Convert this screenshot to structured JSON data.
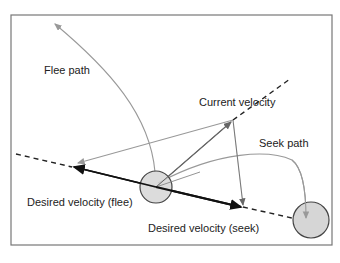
{
  "diagram": {
    "labels": {
      "flee_path": "Flee path",
      "current_velocity": "Current velocity",
      "seek_path": "Seek path",
      "desired_flee": "Desired velocity (flee)",
      "desired_seek": "Desired velocity (seek)"
    },
    "colors": {
      "frame": "#777777",
      "path": "#999999",
      "vector": "#666666",
      "desired": "#111111",
      "circle_fill": "#d6d6d6",
      "circle_stroke": "#444444"
    },
    "elements": [
      "agent-circle",
      "target-circle",
      "flee-path-curve",
      "seek-path-curve",
      "current-velocity-vector",
      "desired-velocity-flee-vector",
      "desired-velocity-seek-vector",
      "steering-vectors",
      "dashed-guide-line"
    ]
  }
}
